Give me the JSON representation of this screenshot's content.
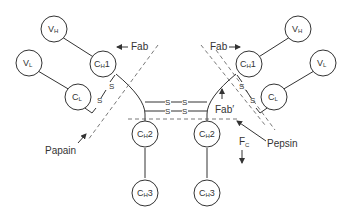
{
  "diagram": {
    "domains": {
      "vh_left": {
        "main": "V",
        "sub": "H",
        "suffix": ""
      },
      "vl_left": {
        "main": "V",
        "sub": "L",
        "suffix": ""
      },
      "ch1_left": {
        "main": "C",
        "sub": "H",
        "suffix": "1"
      },
      "cl_left": {
        "main": "C",
        "sub": "L",
        "suffix": ""
      },
      "ch2_left": {
        "main": "C",
        "sub": "H",
        "suffix": "2"
      },
      "ch3_left": {
        "main": "C",
        "sub": "H",
        "suffix": "3"
      },
      "vh_right": {
        "main": "V",
        "sub": "H",
        "suffix": ""
      },
      "vl_right": {
        "main": "V",
        "sub": "L",
        "suffix": ""
      },
      "ch1_right": {
        "main": "C",
        "sub": "H",
        "suffix": "1"
      },
      "cl_right": {
        "main": "C",
        "sub": "L",
        "suffix": ""
      },
      "ch2_right": {
        "main": "C",
        "sub": "H",
        "suffix": "2"
      },
      "ch3_right": {
        "main": "C",
        "sub": "H",
        "suffix": "3"
      }
    },
    "labels": {
      "fab_left": "Fab",
      "fab_right": "Fab",
      "fab_prime": "Fab′",
      "fc_main": "F",
      "fc_sub": "C",
      "papain": "Papain",
      "pepsin": "Pepsin"
    },
    "disulfide": {
      "s": "S",
      "bond": "S — S"
    },
    "colors": {
      "stroke": "#333333",
      "dashed": "#555555",
      "background": "#ffffff"
    }
  }
}
